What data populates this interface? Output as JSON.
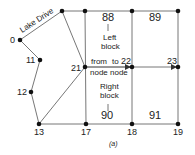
{
  "diagram": {
    "caption": "(a)",
    "street_label": "Lake Drive",
    "colors": {
      "line": "#777777",
      "node": "#111111",
      "text": "#222222"
    },
    "nodes": [
      {
        "id": "0",
        "label": "0"
      },
      {
        "id": "11",
        "label": "11"
      },
      {
        "id": "12",
        "label": "12"
      },
      {
        "id": "13",
        "label": "13"
      },
      {
        "id": "17",
        "label": "17"
      },
      {
        "id": "18",
        "label": "18"
      },
      {
        "id": "19",
        "label": "19"
      },
      {
        "id": "21",
        "label": "21"
      },
      {
        "id": "22",
        "label": "22"
      },
      {
        "id": "23",
        "label": "23"
      }
    ],
    "blocks": [
      {
        "id": "88",
        "label": "88"
      },
      {
        "id": "89",
        "label": "89"
      },
      {
        "id": "90",
        "label": "90"
      },
      {
        "id": "91",
        "label": "91"
      }
    ],
    "annotations": {
      "left_block_line1": "Left",
      "left_block_line2": "block",
      "right_block_line1": "Right",
      "right_block_line2": "block",
      "from_node_line1": "from",
      "from_node_line2": "node",
      "to_node_line1": "to",
      "to_node_line2": "node"
    }
  }
}
